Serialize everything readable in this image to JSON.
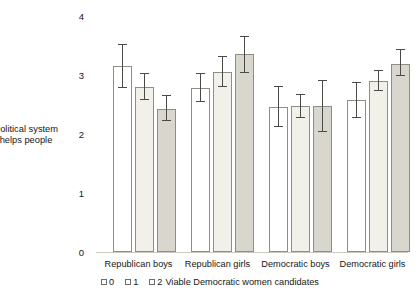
{
  "chart_data": {
    "type": "bar",
    "title": "",
    "xlabel": "Viable Democratic women candidates",
    "ylabel": "Political system helps people",
    "ylim": [
      0,
      4
    ],
    "yticks": [
      0,
      1,
      2,
      3,
      4
    ],
    "ytick_labels": [
      "0",
      "1",
      "2",
      "3",
      "4"
    ],
    "grid": false,
    "legend_position": "bottom-left",
    "error_bars": "confidence interval",
    "categories": [
      "Republican boys",
      "Republican girls",
      "Democratic boys",
      "Democratic girls"
    ],
    "series": [
      {
        "name": "0",
        "swatch": "#ffffff",
        "values": [
          3.12,
          2.76,
          2.44,
          2.55
        ],
        "err_low": [
          2.76,
          2.52,
          2.1,
          2.26
        ],
        "err_high": [
          3.48,
          3.0,
          2.78,
          2.84
        ]
      },
      {
        "name": "1",
        "swatch": "#f1f0e9",
        "values": [
          2.77,
          3.03,
          2.45,
          2.87
        ],
        "err_low": [
          2.56,
          2.78,
          2.26,
          2.7
        ],
        "err_high": [
          2.99,
          3.28,
          2.64,
          3.05
        ]
      },
      {
        "name": "2",
        "swatch": "#d9d7cd",
        "values": [
          2.4,
          3.32,
          2.45,
          3.16
        ],
        "err_low": [
          2.2,
          3.01,
          2.02,
          2.95
        ],
        "err_high": [
          2.63,
          3.62,
          2.88,
          3.4
        ]
      }
    ]
  },
  "axis": {
    "y_title_line1": "Political system",
    "y_title_line2": "helps people",
    "ytick_4": "4",
    "ytick_3": "3",
    "ytick_2": "2",
    "ytick_1": "1",
    "ytick_0": "0"
  },
  "xlabels": {
    "g0": "Republican boys",
    "g1": "Republican girls",
    "g2": "Democratic boys",
    "g3": "Democratic girls"
  },
  "legend": {
    "item0": "0",
    "item1": "1",
    "item2": "2",
    "axis_title": "Viable Democratic women candidates"
  }
}
